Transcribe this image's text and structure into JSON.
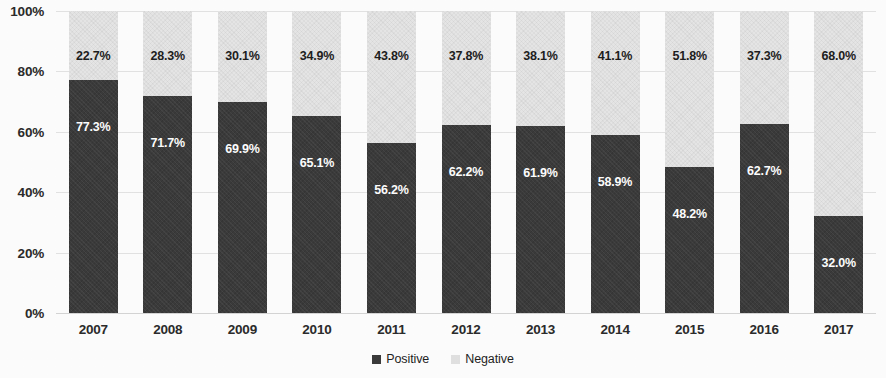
{
  "chart_data": {
    "type": "bar",
    "subtype": "stacked-100-percent",
    "title": "",
    "xlabel": "",
    "ylabel": "",
    "ylim": [
      0,
      100
    ],
    "ytick_labels": [
      "100%",
      "80%",
      "60%",
      "40%",
      "20%",
      "0%"
    ],
    "ytick_values": [
      100,
      80,
      60,
      40,
      20,
      0
    ],
    "grid": true,
    "legend_position": "bottom-center",
    "categories": [
      "2007",
      "2008",
      "2009",
      "2010",
      "2011",
      "2012",
      "2013",
      "2014",
      "2015",
      "2016",
      "2017"
    ],
    "series": [
      {
        "name": "Positive",
        "color": "#3b3b3b",
        "values": [
          77.3,
          71.7,
          69.9,
          65.1,
          56.2,
          62.2,
          61.9,
          58.9,
          48.2,
          62.7,
          32.0
        ],
        "labels": [
          "77.3%",
          "71.7%",
          "69.9%",
          "65.1%",
          "56.2%",
          "62.2%",
          "61.9%",
          "58.9%",
          "48.2%",
          "62.7%",
          "32.0%"
        ]
      },
      {
        "name": "Negative",
        "color": "#e7e7e7",
        "values": [
          22.7,
          28.3,
          30.1,
          34.9,
          43.8,
          37.8,
          38.1,
          41.1,
          51.8,
          37.3,
          68.0
        ],
        "labels": [
          "22.7%",
          "28.3%",
          "30.1%",
          "34.9%",
          "43.8%",
          "37.8%",
          "38.1%",
          "41.1%",
          "51.8%",
          "37.3%",
          "68.0%"
        ]
      }
    ]
  },
  "legend": {
    "items": [
      {
        "label": "Positive",
        "swatch": "positive"
      },
      {
        "label": "Negative",
        "swatch": "negative"
      }
    ]
  }
}
